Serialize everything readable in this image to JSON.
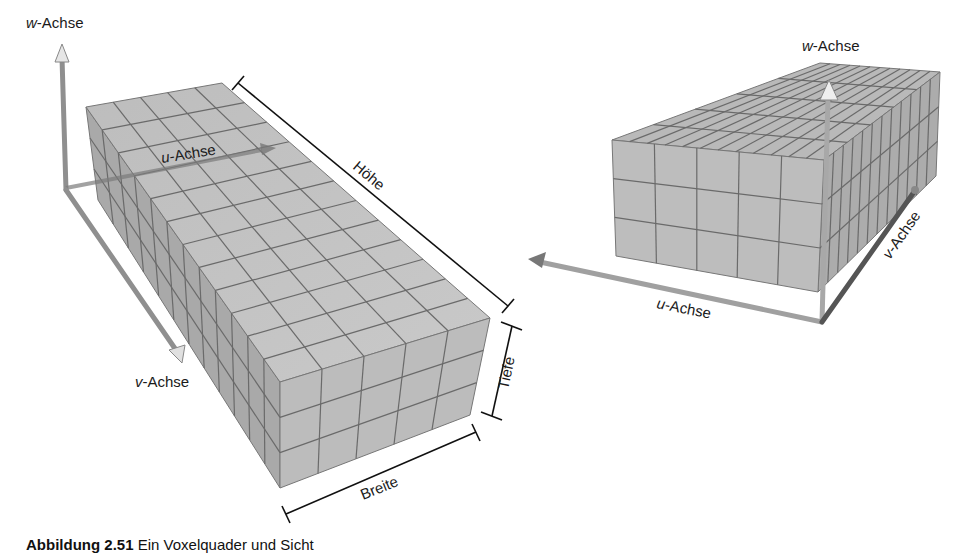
{
  "figure": {
    "left_view": {
      "axes": {
        "w": {
          "prefix": "w",
          "suffix": "-Achse"
        },
        "u": {
          "prefix": "u",
          "suffix": "-Achse"
        },
        "v": {
          "prefix": "v",
          "suffix": "-Achse"
        }
      },
      "dimensions": {
        "height": "Höhe",
        "depth": "Tiefe",
        "width": "Breite"
      },
      "grid": {
        "cols_width": 5,
        "rows_depth": 3,
        "cells_length": 12
      }
    },
    "right_view": {
      "axes": {
        "w": {
          "prefix": "w",
          "suffix": "-Achse"
        },
        "u": {
          "prefix": "u",
          "suffix": "-Achse"
        },
        "v": {
          "prefix": "v",
          "suffix": "-Achse"
        }
      },
      "grid": {
        "cols_width": 5,
        "rows_depth": 3,
        "cells_length": 12
      }
    },
    "colors": {
      "voxel_face": "#b8b8b8",
      "voxel_top": "#c4c4c4",
      "voxel_side": "#a8a8a8",
      "grid_line": "#6a6a6a",
      "axis": "#9a9a9a",
      "text": "#1a1a1a"
    }
  },
  "caption": {
    "label": "Abbildung 2.51",
    "text": " Ein Voxelquader und Sicht"
  }
}
